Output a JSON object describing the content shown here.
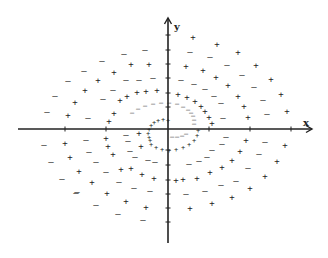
{
  "diagram": {
    "axes": {
      "x_label": "x",
      "y_label": "y",
      "origin": [
        168,
        129
      ],
      "x_range_px": [
        18,
        312
      ],
      "y_range_px": [
        18,
        243
      ],
      "x_ticks_px": [
        65,
        106,
        209,
        250,
        291
      ],
      "y_ticks_px": [
        35,
        50,
        64,
        78,
        93,
        107,
        150,
        165,
        180,
        194,
        208,
        222
      ],
      "color": "#222222"
    },
    "symbols": {
      "plus": "+",
      "minus": "–"
    },
    "points_large": [
      {
        "s": "minus",
        "x": 124,
        "y": 54
      },
      {
        "s": "minus",
        "x": 145,
        "y": 50
      },
      {
        "s": "minus",
        "x": 102,
        "y": 61
      },
      {
        "s": "plus",
        "x": 131,
        "y": 64
      },
      {
        "s": "plus",
        "x": 149,
        "y": 64
      },
      {
        "s": "minus",
        "x": 84,
        "y": 71
      },
      {
        "s": "plus",
        "x": 114,
        "y": 72
      },
      {
        "s": "minus",
        "x": 68,
        "y": 81
      },
      {
        "s": "plus",
        "x": 98,
        "y": 80
      },
      {
        "s": "minus",
        "x": 126,
        "y": 80
      },
      {
        "s": "minus",
        "x": 139,
        "y": 80
      },
      {
        "s": "minus",
        "x": 153,
        "y": 78
      },
      {
        "s": "minus",
        "x": 55,
        "y": 96
      },
      {
        "s": "plus",
        "x": 85,
        "y": 90
      },
      {
        "s": "minus",
        "x": 113,
        "y": 90
      },
      {
        "s": "plus",
        "x": 137,
        "y": 92
      },
      {
        "s": "plus",
        "x": 146,
        "y": 91
      },
      {
        "s": "plus",
        "x": 157,
        "y": 90
      },
      {
        "s": "minus",
        "x": 47,
        "y": 112
      },
      {
        "s": "plus",
        "x": 75,
        "y": 102
      },
      {
        "s": "minus",
        "x": 103,
        "y": 99
      },
      {
        "s": "plus",
        "x": 120,
        "y": 100
      },
      {
        "s": "plus",
        "x": 127,
        "y": 96
      },
      {
        "s": "plus",
        "x": 68,
        "y": 115
      },
      {
        "s": "minus",
        "x": 88,
        "y": 118
      },
      {
        "s": "plus",
        "x": 114,
        "y": 113
      },
      {
        "s": "plus",
        "x": 109,
        "y": 121
      },
      {
        "s": "plus",
        "x": 193,
        "y": 37
      },
      {
        "s": "plus",
        "x": 217,
        "y": 44
      },
      {
        "s": "minus",
        "x": 190,
        "y": 52
      },
      {
        "s": "minus",
        "x": 210,
        "y": 57
      },
      {
        "s": "plus",
        "x": 238,
        "y": 52
      },
      {
        "s": "plus",
        "x": 186,
        "y": 66
      },
      {
        "s": "plus",
        "x": 203,
        "y": 70
      },
      {
        "s": "minus",
        "x": 227,
        "y": 65
      },
      {
        "s": "plus",
        "x": 256,
        "y": 65
      },
      {
        "s": "minus",
        "x": 181,
        "y": 80
      },
      {
        "s": "minus",
        "x": 194,
        "y": 84
      },
      {
        "s": "plus",
        "x": 216,
        "y": 77
      },
      {
        "s": "minus",
        "x": 242,
        "y": 75
      },
      {
        "s": "plus",
        "x": 271,
        "y": 79
      },
      {
        "s": "plus",
        "x": 178,
        "y": 94
      },
      {
        "s": "plus",
        "x": 187,
        "y": 97
      },
      {
        "s": "minus",
        "x": 205,
        "y": 89
      },
      {
        "s": "plus",
        "x": 228,
        "y": 85
      },
      {
        "s": "minus",
        "x": 254,
        "y": 87
      },
      {
        "s": "plus",
        "x": 281,
        "y": 94
      },
      {
        "s": "plus",
        "x": 195,
        "y": 101
      },
      {
        "s": "minus",
        "x": 214,
        "y": 96
      },
      {
        "s": "plus",
        "x": 238,
        "y": 96
      },
      {
        "s": "minus",
        "x": 263,
        "y": 100
      },
      {
        "s": "plus",
        "x": 287,
        "y": 111
      },
      {
        "s": "plus",
        "x": 201,
        "y": 106
      },
      {
        "s": "minus",
        "x": 221,
        "y": 103
      },
      {
        "s": "plus",
        "x": 244,
        "y": 106
      },
      {
        "s": "plus",
        "x": 248,
        "y": 117
      },
      {
        "s": "minus",
        "x": 267,
        "y": 114
      },
      {
        "s": "plus",
        "x": 205,
        "y": 111
      },
      {
        "s": "plus",
        "x": 209,
        "y": 117
      },
      {
        "s": "minus",
        "x": 223,
        "y": 118
      },
      {
        "s": "plus",
        "x": 212,
        "y": 123
      },
      {
        "s": "minus",
        "x": 126,
        "y": 135
      },
      {
        "s": "minus",
        "x": 128,
        "y": 141
      },
      {
        "s": "plus",
        "x": 139,
        "y": 133
      },
      {
        "s": "plus",
        "x": 141,
        "y": 146
      },
      {
        "s": "minus",
        "x": 44,
        "y": 145
      },
      {
        "s": "plus",
        "x": 65,
        "y": 143
      },
      {
        "s": "minus",
        "x": 86,
        "y": 140
      },
      {
        "s": "plus",
        "x": 106,
        "y": 138
      },
      {
        "s": "plus",
        "x": 108,
        "y": 146
      },
      {
        "s": "minus",
        "x": 51,
        "y": 162
      },
      {
        "s": "plus",
        "x": 70,
        "y": 157
      },
      {
        "s": "minus",
        "x": 89,
        "y": 152
      },
      {
        "s": "minus",
        "x": 96,
        "y": 162
      },
      {
        "s": "plus",
        "x": 113,
        "y": 154
      },
      {
        "s": "minus",
        "x": 130,
        "y": 151
      },
      {
        "s": "minus",
        "x": 135,
        "y": 157
      },
      {
        "s": "minus",
        "x": 148,
        "y": 160
      },
      {
        "s": "minus",
        "x": 62,
        "y": 179
      },
      {
        "s": "plus",
        "x": 79,
        "y": 171
      },
      {
        "s": "minus",
        "x": 106,
        "y": 172
      },
      {
        "s": "plus",
        "x": 121,
        "y": 169
      },
      {
        "s": "plus",
        "x": 131,
        "y": 168
      },
      {
        "s": "plus",
        "x": 142,
        "y": 174
      },
      {
        "s": "minus",
        "x": 155,
        "y": 162
      },
      {
        "s": "minus",
        "x": 77,
        "y": 192
      },
      {
        "s": "plus",
        "x": 92,
        "y": 182
      },
      {
        "s": "minus",
        "x": 119,
        "y": 182
      },
      {
        "s": "minus",
        "x": 134,
        "y": 188
      },
      {
        "s": "plus",
        "x": 154,
        "y": 178
      },
      {
        "s": "minus",
        "x": 150,
        "y": 191
      },
      {
        "s": "minus",
        "x": 76,
        "y": 193
      },
      {
        "s": "plus",
        "x": 107,
        "y": 193
      },
      {
        "s": "plus",
        "x": 126,
        "y": 201
      },
      {
        "s": "plus",
        "x": 146,
        "y": 207
      },
      {
        "s": "minus",
        "x": 96,
        "y": 205
      },
      {
        "s": "minus",
        "x": 118,
        "y": 214
      },
      {
        "s": "minus",
        "x": 143,
        "y": 220
      },
      {
        "s": "minus",
        "x": 226,
        "y": 137
      },
      {
        "s": "plus",
        "x": 246,
        "y": 140
      },
      {
        "s": "minus",
        "x": 265,
        "y": 142
      },
      {
        "s": "plus",
        "x": 285,
        "y": 145
      },
      {
        "s": "minus",
        "x": 222,
        "y": 144
      },
      {
        "s": "plus",
        "x": 240,
        "y": 151
      },
      {
        "s": "minus",
        "x": 259,
        "y": 154
      },
      {
        "s": "plus",
        "x": 277,
        "y": 161
      },
      {
        "s": "minus",
        "x": 212,
        "y": 150
      },
      {
        "s": "plus",
        "x": 232,
        "y": 160
      },
      {
        "s": "minus",
        "x": 248,
        "y": 168
      },
      {
        "s": "plus",
        "x": 265,
        "y": 176
      },
      {
        "s": "minus",
        "x": 207,
        "y": 157
      },
      {
        "s": "plus",
        "x": 222,
        "y": 167
      },
      {
        "s": "minus",
        "x": 236,
        "y": 181
      },
      {
        "s": "plus",
        "x": 250,
        "y": 188
      },
      {
        "s": "minus",
        "x": 199,
        "y": 161
      },
      {
        "s": "plus",
        "x": 210,
        "y": 172
      },
      {
        "s": "minus",
        "x": 221,
        "y": 185
      },
      {
        "s": "plus",
        "x": 232,
        "y": 197
      },
      {
        "s": "minus",
        "x": 189,
        "y": 164
      },
      {
        "s": "plus",
        "x": 197,
        "y": 178
      },
      {
        "s": "minus",
        "x": 205,
        "y": 191
      },
      {
        "s": "plus",
        "x": 212,
        "y": 203
      },
      {
        "s": "plus",
        "x": 183,
        "y": 179
      },
      {
        "s": "minus",
        "x": 186,
        "y": 194
      },
      {
        "s": "plus",
        "x": 190,
        "y": 208
      },
      {
        "s": "plus",
        "x": 176,
        "y": 180
      }
    ],
    "spiral_outer": [
      {
        "s": "minus",
        "x": 145,
        "y": 106
      },
      {
        "s": "minus",
        "x": 153,
        "y": 104
      },
      {
        "s": "minus",
        "x": 161,
        "y": 103
      },
      {
        "s": "minus",
        "x": 169,
        "y": 103
      },
      {
        "s": "minus",
        "x": 177,
        "y": 104
      },
      {
        "s": "minus",
        "x": 183,
        "y": 107
      },
      {
        "s": "minus",
        "x": 188,
        "y": 110
      },
      {
        "s": "minus",
        "x": 191,
        "y": 113
      },
      {
        "s": "minus",
        "x": 193,
        "y": 116
      },
      {
        "s": "minus",
        "x": 194,
        "y": 120
      },
      {
        "s": "minus",
        "x": 194,
        "y": 124
      },
      {
        "s": "minus",
        "x": 138,
        "y": 109
      },
      {
        "s": "minus",
        "x": 132,
        "y": 113
      },
      {
        "s": "plus",
        "x": 198,
        "y": 131
      },
      {
        "s": "plus",
        "x": 197,
        "y": 136
      },
      {
        "s": "plus",
        "x": 194,
        "y": 141
      },
      {
        "s": "plus",
        "x": 189,
        "y": 145
      },
      {
        "s": "plus",
        "x": 183,
        "y": 148
      },
      {
        "s": "plus",
        "x": 176,
        "y": 150
      },
      {
        "s": "plus",
        "x": 169,
        "y": 151
      },
      {
        "s": "plus",
        "x": 162,
        "y": 150
      },
      {
        "s": "plus",
        "x": 156,
        "y": 148
      },
      {
        "s": "plus",
        "x": 151,
        "y": 145
      }
    ],
    "spiral_inner": [
      {
        "s": "plus",
        "x": 168,
        "y": 121
      },
      {
        "s": "plus",
        "x": 163,
        "y": 120
      },
      {
        "s": "plus",
        "x": 158,
        "y": 121
      },
      {
        "s": "plus",
        "x": 154,
        "y": 123
      },
      {
        "s": "plus",
        "x": 151,
        "y": 126
      },
      {
        "s": "plus",
        "x": 149,
        "y": 130
      },
      {
        "s": "plus",
        "x": 148,
        "y": 134
      },
      {
        "s": "plus",
        "x": 149,
        "y": 138
      },
      {
        "s": "plus",
        "x": 150,
        "y": 141
      },
      {
        "s": "minus",
        "x": 172,
        "y": 137
      },
      {
        "s": "minus",
        "x": 177,
        "y": 137
      },
      {
        "s": "minus",
        "x": 182,
        "y": 136
      },
      {
        "s": "minus",
        "x": 186,
        "y": 134
      }
    ]
  }
}
